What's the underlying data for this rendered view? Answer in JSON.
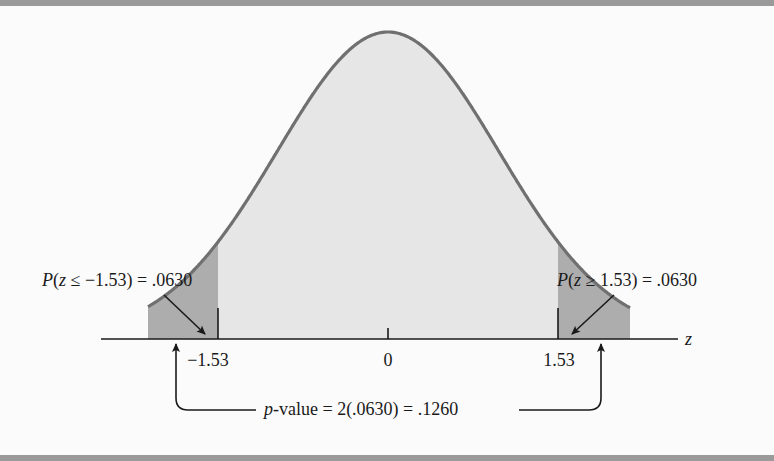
{
  "chart_data": {
    "type": "area",
    "xlabel": "z",
    "ylabel": "",
    "distribution": "standard normal",
    "x_ticks": [
      -1.53,
      0,
      1.53
    ],
    "x_tick_labels": [
      "−1.53",
      "0",
      "1.53"
    ],
    "shaded_regions": [
      {
        "name": "left tail",
        "range": [
          null,
          -1.53
        ],
        "probability": 0.063
      },
      {
        "name": "right tail",
        "range": [
          1.53,
          null
        ],
        "probability": 0.063
      }
    ],
    "annotations": [
      "P(z ≤ −1.53) = .0630",
      "P(z ≥ 1.53) = .0630",
      "p-value = 2(.0630) = .1260"
    ],
    "p_value": 0.126,
    "grid": false,
    "legend": null
  },
  "labels": {
    "left_prob_prefix": "P",
    "left_prob_body": "(",
    "left_prob_var": "z",
    "left_prob_rest": " ≤ −1.53) = .0630",
    "right_prob_prefix": "P",
    "right_prob_body": "(",
    "right_prob_var": "z",
    "right_prob_rest": " ≥ 1.53) = .0630",
    "axis_var": "z",
    "tick_neg": "−1.53",
    "tick_zero": "0",
    "tick_pos": "1.53",
    "pvalue_var": "p",
    "pvalue_rest": "-value = 2(.0630) = .1260"
  },
  "colors": {
    "background": "#fbfbfb",
    "frame": "#9a9a9a",
    "curve_stroke": "#707070",
    "curve_fill": "#e6e6e6",
    "tail_fill": "#adadad",
    "ink": "#1a1a1a"
  }
}
